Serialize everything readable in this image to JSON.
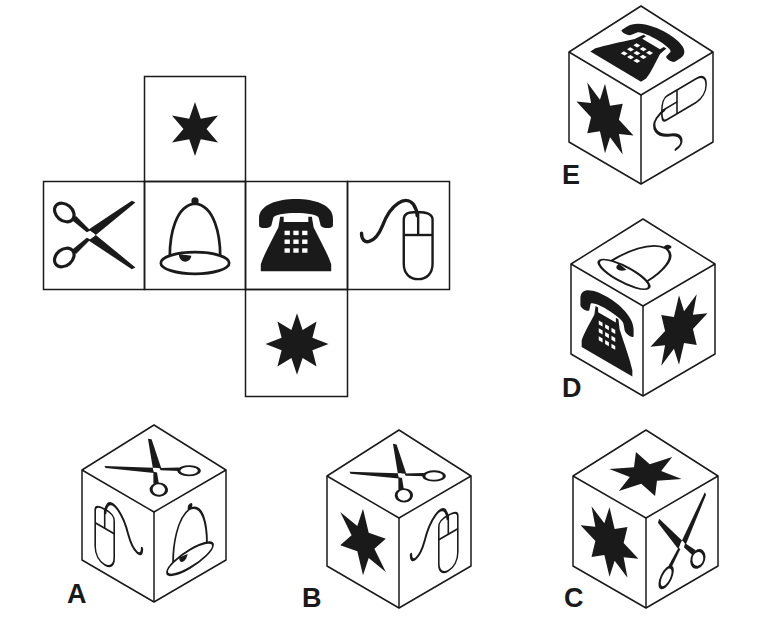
{
  "puzzle": {
    "type": "cube-net-folding",
    "net": {
      "layout": "cross",
      "faces": [
        {
          "position": "top",
          "icon": "star-6-point"
        },
        {
          "position": "row-1",
          "icon": "scissors"
        },
        {
          "position": "row-2",
          "icon": "bell"
        },
        {
          "position": "row-3",
          "icon": "telephone"
        },
        {
          "position": "row-4",
          "icon": "computer-mouse"
        },
        {
          "position": "bottom",
          "icon": "star-8-point"
        }
      ]
    },
    "options": [
      {
        "label": "A",
        "top": "scissors",
        "left": "computer-mouse",
        "right": "bell"
      },
      {
        "label": "B",
        "top": "scissors",
        "left": "star-6-point",
        "right": "computer-mouse"
      },
      {
        "label": "C",
        "top": "star-6-point",
        "left": "star-8-point",
        "right": "scissors"
      },
      {
        "label": "D",
        "top": "bell",
        "left": "telephone",
        "right": "star-8-point"
      },
      {
        "label": "E",
        "top": "telephone",
        "left": "star-8-point",
        "right": "computer-mouse"
      }
    ]
  },
  "colors": {
    "ink": "#1a1a1a",
    "background": "#ffffff"
  }
}
